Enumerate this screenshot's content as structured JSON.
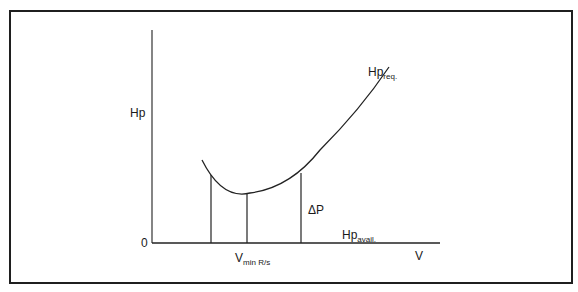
{
  "diagram": {
    "type": "power-required-vs-velocity",
    "y_axis": {
      "label": "Hp",
      "origin_label": "0"
    },
    "x_axis": {
      "label": "V"
    },
    "curves": [
      {
        "name": "Hp_req",
        "label_main": "Hp",
        "label_sub": "req."
      },
      {
        "name": "Hp_avail",
        "label_main": "Hp",
        "label_sub": "avail."
      }
    ],
    "annotations": {
      "delta_p": "ΔP",
      "vmin_main": "V",
      "vmin_sub": "min R/s"
    }
  },
  "colors": {
    "stroke": "#222222",
    "frame": "#1f1f1f",
    "background": "#ffffff"
  }
}
